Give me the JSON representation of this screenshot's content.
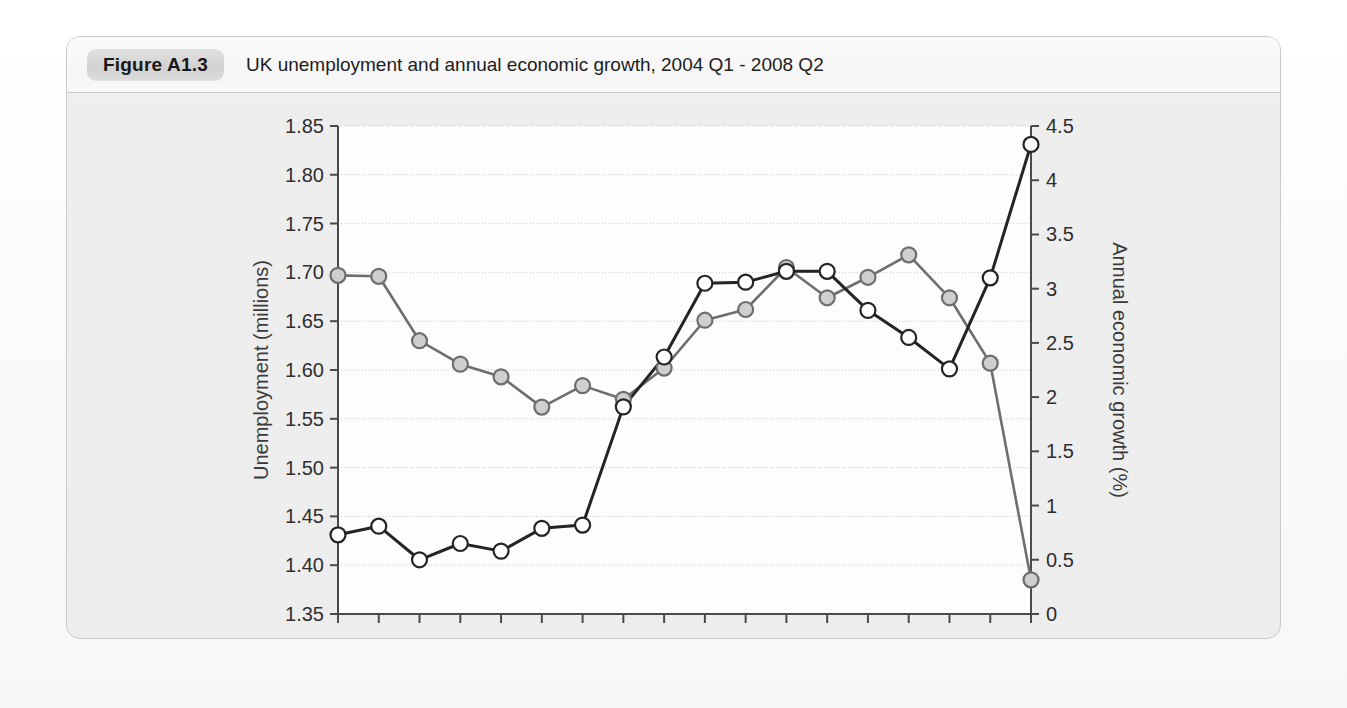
{
  "figure": {
    "tag": "Figure A1.3",
    "title": "UK unemployment and annual economic growth, 2004 Q1 - 2008 Q2"
  },
  "chart_data": {
    "type": "line",
    "title": "UK unemployment and annual economic growth, 2004 Q1 - 2008 Q2",
    "xlabel": "",
    "grid": true,
    "legend": "none",
    "x": [
      "2004 Q1",
      "2004 Q2",
      "2004 Q3",
      "2004 Q4",
      "2005 Q1",
      "2005 Q2",
      "2005 Q3",
      "2005 Q4",
      "2006 Q1",
      "2006 Q2",
      "2006 Q3",
      "2006 Q4",
      "2007 Q1",
      "2007 Q2",
      "2007 Q3",
      "2007 Q4",
      "2008 Q1",
      "2008 Q2"
    ],
    "xtick_labels": [
      "2004",
      "2005",
      "2006",
      "2007",
      "2008"
    ],
    "xtick_positions": [
      0,
      4,
      8,
      12,
      16
    ],
    "left_axis": {
      "label": "Unemployment (millions)",
      "ylim": [
        1.35,
        1.85
      ],
      "ticks": [
        "1.35",
        "1.40",
        "1.45",
        "1.50",
        "1.55",
        "1.60",
        "1.65",
        "1.70",
        "1.75",
        "1.80",
        "1.85"
      ],
      "tick_values": [
        1.35,
        1.4,
        1.45,
        1.5,
        1.55,
        1.6,
        1.65,
        1.7,
        1.75,
        1.8,
        1.85
      ]
    },
    "right_axis": {
      "label": "Annual economic growth (%)",
      "ylim": [
        0,
        4.5
      ],
      "ticks": [
        "0",
        "0.5",
        "1",
        "1.5",
        "2",
        "2.5",
        "3",
        "3.5",
        "4",
        "4.5"
      ],
      "tick_values": [
        0,
        0.5,
        1,
        1.5,
        2,
        2.5,
        3,
        3.5,
        4,
        4.5
      ]
    },
    "series": [
      {
        "name": "Unemployment (millions)",
        "axis": "left",
        "marker": "filled-circle",
        "marker_fill": "#cfcfcf",
        "line_color": "#6e6e6e",
        "values": [
          1.697,
          1.696,
          1.63,
          1.606,
          1.593,
          1.562,
          1.584,
          1.57,
          1.602,
          1.651,
          1.662,
          1.705,
          1.674,
          1.695,
          1.718,
          1.674,
          1.607,
          1.385
        ]
      },
      {
        "name": "Annual economic growth (%)",
        "axis": "right",
        "marker": "open-circle",
        "marker_fill": "#ffffff",
        "line_color": "#242424",
        "values": [
          0.73,
          0.81,
          0.5,
          0.65,
          0.58,
          0.79,
          0.82,
          1.91,
          2.37,
          3.05,
          3.06,
          3.16,
          3.16,
          2.8,
          2.55,
          2.26,
          3.1,
          4.33
        ]
      }
    ]
  }
}
